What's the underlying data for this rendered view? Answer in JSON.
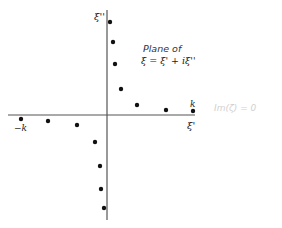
{
  "diagram": {
    "title_line1": "Plane of",
    "title_line2": "ξ = ξ' + iξ''",
    "vertical_axis_label": "ξ''",
    "horizontal_axis_label": "ξ'",
    "right_marker_label": "k",
    "left_marker_label": "−k",
    "faint_annotation": "Im(ζ) = 0",
    "colors": {
      "axis": "#555555",
      "points": "#111111",
      "text": "#222222"
    },
    "axes_px": {
      "vertical_x": 107,
      "vertical_y_top": 10,
      "vertical_y_bottom": 220,
      "horizontal_y": 115,
      "horizontal_x_left": 8,
      "horizontal_x_right": 195
    },
    "points_px": [
      {
        "x": 110,
        "y": 22
      },
      {
        "x": 113,
        "y": 42
      },
      {
        "x": 115,
        "y": 64
      },
      {
        "x": 121,
        "y": 89
      },
      {
        "x": 137,
        "y": 105
      },
      {
        "x": 166,
        "y": 110
      },
      {
        "x": 193,
        "y": 111
      },
      {
        "x": 21,
        "y": 119
      },
      {
        "x": 48,
        "y": 121
      },
      {
        "x": 77,
        "y": 125
      },
      {
        "x": 95,
        "y": 142
      },
      {
        "x": 100,
        "y": 166
      },
      {
        "x": 101,
        "y": 189
      },
      {
        "x": 104,
        "y": 208
      }
    ]
  }
}
